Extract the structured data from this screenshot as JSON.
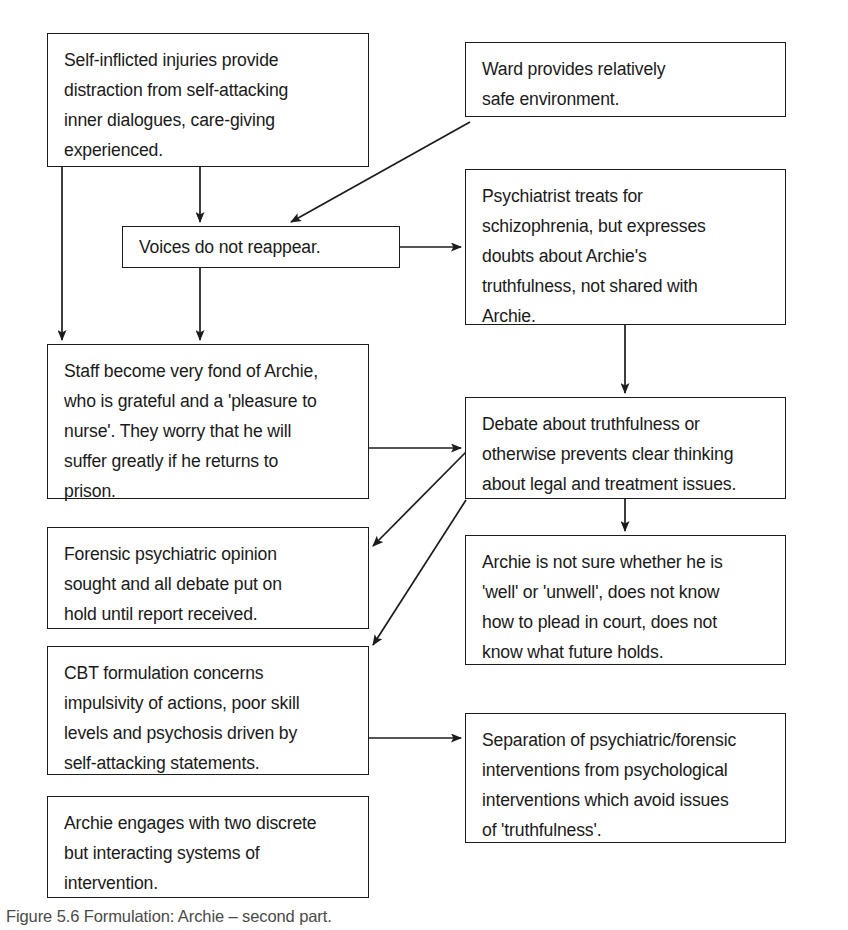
{
  "figure": {
    "caption": "Figure 5.6  Formulation: Archie – second part.",
    "line_color": "#1c1c1c",
    "text_color": "#1a1a1a",
    "background": "#ffffff"
  },
  "nodes": [
    {
      "id": "self-inflicted-injuries",
      "text": "Self-inflicted injuries provide\ndistraction from self-attacking\ninner dialogues, care-giving\nexperienced.",
      "x": 47,
      "y": 33,
      "w": 322,
      "h": 134
    },
    {
      "id": "ward-safe-environment",
      "text": "Ward provides relatively\nsafe environment.",
      "x": 465,
      "y": 42,
      "w": 321,
      "h": 75
    },
    {
      "id": "voices-do-not-reappear",
      "text": "Voices do not reappear.",
      "x": 122,
      "y": 226,
      "w": 278,
      "h": 42
    },
    {
      "id": "psychiatrist-treats-schizophrenia",
      "text": "Psychiatrist treats for\nschizophrenia, but expresses\ndoubts about Archie's\ntruthfulness, not shared with\nArchie.",
      "x": 465,
      "y": 169,
      "w": 321,
      "h": 156
    },
    {
      "id": "staff-fond-of-archie",
      "text": "Staff become very fond of Archie,\nwho is grateful and a 'pleasure to\nnurse'. They worry that he will\nsuffer greatly if he returns to\nprison.",
      "x": 47,
      "y": 344,
      "w": 322,
      "h": 155
    },
    {
      "id": "debate-about-truthfulness",
      "text": "Debate about truthfulness or\notherwise prevents clear thinking\nabout legal and treatment issues.",
      "x": 465,
      "y": 397,
      "w": 321,
      "h": 102
    },
    {
      "id": "forensic-opinion-sought",
      "text": "Forensic psychiatric opinion\nsought and all debate put on\nhold until report received.",
      "x": 47,
      "y": 527,
      "w": 322,
      "h": 102
    },
    {
      "id": "archie-not-sure-whether-well",
      "text": "Archie is not sure whether he is\n'well' or 'unwell', does not know\nhow to plead in court, does not\nknow what future holds.",
      "x": 465,
      "y": 535,
      "w": 321,
      "h": 130
    },
    {
      "id": "cbt-formulation-concerns",
      "text": "CBT formulation concerns\nimpulsivity of actions, poor skill\nlevels and psychosis driven by\nself-attacking statements.",
      "x": 47,
      "y": 646,
      "w": 322,
      "h": 129
    },
    {
      "id": "separation-of-interventions",
      "text": "Separation of psychiatric/forensic\ninterventions from psychological\ninterventions which avoid issues\nof 'truthfulness'.",
      "x": 465,
      "y": 713,
      "w": 321,
      "h": 130
    },
    {
      "id": "archie-engages-two-systems",
      "text": "Archie engages with two discrete\nbut interacting systems of\nintervention.",
      "x": 47,
      "y": 796,
      "w": 322,
      "h": 102
    }
  ],
  "connectors": [
    {
      "id": "injuries-to-voices",
      "from": "self-inflicted-injuries",
      "to": "voices-do-not-reappear",
      "kind": "vertical-arrow"
    },
    {
      "id": "injuries-to-staff",
      "from": "self-inflicted-injuries",
      "to": "staff-fond-of-archie",
      "kind": "vertical-arrow"
    },
    {
      "id": "voices-to-staff",
      "from": "voices-do-not-reappear",
      "to": "staff-fond-of-archie",
      "kind": "vertical-arrow"
    },
    {
      "id": "ward-to-voices",
      "from": "ward-safe-environment",
      "to": "voices-do-not-reappear",
      "kind": "diagonal-arrow"
    },
    {
      "id": "voices-to-psychiatrist",
      "from": "voices-do-not-reappear",
      "to": "psychiatrist-treats-schizophrenia",
      "kind": "horizontal-arrow"
    },
    {
      "id": "psychiatrist-to-debate",
      "from": "psychiatrist-treats-schizophrenia",
      "to": "debate-about-truthfulness",
      "kind": "vertical-arrow"
    },
    {
      "id": "staff-to-debate",
      "from": "staff-fond-of-archie",
      "to": "debate-about-truthfulness",
      "kind": "horizontal-arrow"
    },
    {
      "id": "debate-to-archie-not-sure",
      "from": "debate-about-truthfulness",
      "to": "archie-not-sure-whether-well",
      "kind": "vertical-arrow"
    },
    {
      "id": "debate-to-forensic",
      "from": "debate-about-truthfulness",
      "to": "forensic-opinion-sought",
      "kind": "diagonal-arrow"
    },
    {
      "id": "debate-to-cbt",
      "from": "debate-about-truthfulness",
      "to": "cbt-formulation-concerns",
      "kind": "diagonal-arrow"
    },
    {
      "id": "cbt-to-separation",
      "from": "cbt-formulation-concerns",
      "to": "separation-of-interventions",
      "kind": "horizontal-arrow"
    }
  ]
}
